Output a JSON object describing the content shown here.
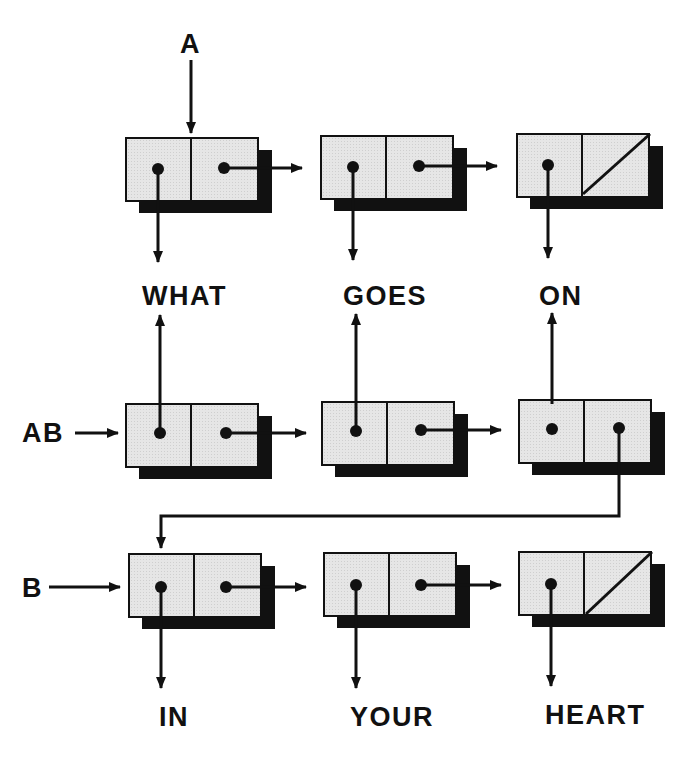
{
  "variables": [
    {
      "name": "A",
      "points_to": "row1.node1"
    },
    {
      "name": "AB",
      "points_to": "row2.node1"
    },
    {
      "name": "B",
      "points_to": "row3.node1"
    }
  ],
  "labels": {
    "var_a": "A",
    "var_ab": "AB",
    "var_b": "B"
  },
  "atoms": {
    "row1": [
      "WHAT",
      "GOES",
      "ON"
    ],
    "row3": [
      "IN",
      "YOUR",
      "HEART"
    ]
  },
  "lists": [
    {
      "name": "A",
      "nodes": [
        {
          "car": "WHAT",
          "cdr": "next"
        },
        {
          "car": "GOES",
          "cdr": "next"
        },
        {
          "car": "ON",
          "cdr": "nil"
        }
      ]
    },
    {
      "name": "AB",
      "nodes": [
        {
          "car": "WHAT",
          "cdr": "next"
        },
        {
          "car": "GOES",
          "cdr": "next"
        },
        {
          "car": "ON",
          "cdr": "B.node1"
        }
      ]
    },
    {
      "name": "B",
      "nodes": [
        {
          "car": "IN",
          "cdr": "next"
        },
        {
          "car": "YOUR",
          "cdr": "next"
        },
        {
          "car": "HEART",
          "cdr": "nil"
        }
      ]
    }
  ],
  "colors": {
    "ink": "#111111",
    "cell_fill": "#e6e6e6",
    "background": "#ffffff"
  }
}
